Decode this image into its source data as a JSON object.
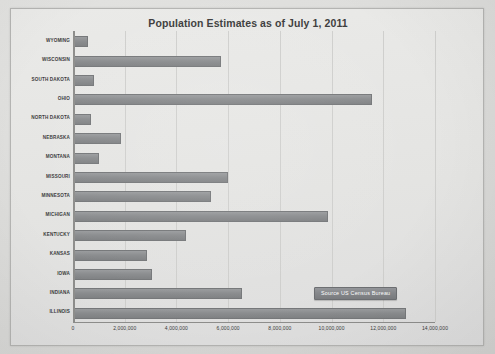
{
  "chart_data": {
    "type": "bar",
    "orientation": "horizontal",
    "title": "Population Estimates as of July 1, 2011",
    "xlabel": "",
    "ylabel": "",
    "xlim": [
      0,
      14000000
    ],
    "xticks": [
      0,
      2000000,
      4000000,
      6000000,
      8000000,
      10000000,
      12000000,
      14000000
    ],
    "xtick_labels": [
      "0",
      "2,000,000",
      "4,000,000",
      "6,000,000",
      "8,000,000",
      "10,000,000",
      "12,000,000",
      "14,000,000"
    ],
    "grid": true,
    "grid_axis": "x",
    "legend": false,
    "categories": [
      "WYOMING",
      "WISCONSIN",
      "SOUTH DAKOTA",
      "OHIO",
      "NORTH DAKOTA",
      "NEBRASKA",
      "MONTANA",
      "MISSOURI",
      "MINNESOTA",
      "MICHIGAN",
      "KENTUCKY",
      "KANSAS",
      "IOWA",
      "INDIANA",
      "ILLINOIS"
    ],
    "values": [
      568158,
      5711767,
      824082,
      11544951,
      683932,
      1842641,
      998199,
      6010688,
      5344861,
      9876187,
      4369356,
      2871238,
      3062309,
      6516922,
      12869257
    ],
    "bar_color": "#8c8e90",
    "bar_edge_color": "#76787a",
    "plot_background": "#e6e6e4",
    "annotations": [
      {
        "text": "Source US Census Bureau",
        "style": "filled-box",
        "fill": "#86888a",
        "text_color": "#ffffff"
      }
    ]
  },
  "frame": {
    "border_color": "#b4b4b2",
    "outer_background": "#d9d9d9"
  }
}
